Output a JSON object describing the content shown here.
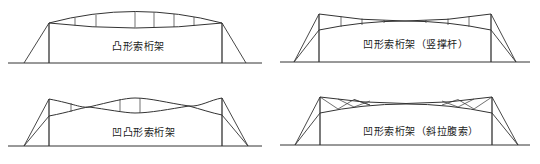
{
  "diagrams": [
    {
      "id": "convex",
      "label": "凸形索桁架",
      "label_pos": [
        112,
        38
      ],
      "ground": {
        "y": 63,
        "x1": 8,
        "x2": 262
      },
      "columns": [
        {
          "x": 49,
          "top": 23
        },
        {
          "x": 222,
          "top": 23
        }
      ],
      "guys": [
        [
          49,
          23,
          24,
          63
        ],
        [
          222,
          23,
          246,
          63
        ]
      ],
      "upper_cable": "M49,23 Q135,0 222,23",
      "lower_cable": "M49,23 Q135,33 222,23",
      "struts": [
        [
          75,
          18,
          75,
          25.5
        ],
        [
          96,
          15,
          96,
          26.5
        ],
        [
          135,
          12,
          135,
          27.5
        ],
        [
          154,
          12.5,
          154,
          27.5
        ],
        [
          174,
          14,
          174,
          27
        ],
        [
          194,
          17,
          194,
          26
        ]
      ]
    },
    {
      "id": "concave-vertical",
      "label": "凹形索桁架（竖撑杆）",
      "label_pos": [
        363,
        36
      ],
      "ground": {
        "y": 62,
        "x1": 280,
        "x2": 530
      },
      "columns": [
        {
          "x": 319,
          "top": 14
        },
        {
          "x": 491,
          "top": 14
        }
      ],
      "guys": [
        [
          319,
          14,
          294,
          62
        ],
        [
          319,
          30,
          294,
          62
        ],
        [
          491,
          14,
          516,
          62
        ],
        [
          491,
          30,
          516,
          62
        ]
      ],
      "upper_cable": "M319,14 Q405,28 491,14",
      "lower_cable": "M319,30 Q405,12 491,30",
      "struts": [
        [
          341,
          16.5,
          341,
          27
        ],
        [
          362,
          18.5,
          362,
          25
        ],
        [
          384,
          20,
          384,
          23
        ],
        [
          426,
          20,
          426,
          23
        ],
        [
          448,
          18.5,
          448,
          25
        ],
        [
          469,
          16.5,
          469,
          27
        ]
      ]
    },
    {
      "id": "concave-convex",
      "label": "凹凸形索桁架",
      "label_pos": [
        112,
        124
      ],
      "ground": {
        "y": 146,
        "x1": 8,
        "x2": 262
      },
      "columns": [
        {
          "x": 49,
          "top": 99
        },
        {
          "x": 222,
          "top": 98
        }
      ],
      "guys": [
        [
          49,
          99,
          24,
          146
        ],
        [
          49,
          116,
          24,
          146
        ],
        [
          222,
          98,
          248,
          146
        ],
        [
          222,
          115,
          248,
          146
        ]
      ],
      "upper_cable": "M49,99 C75,104 80,108 89,107 C110,102 125,98 135,98 C150,98 168,103 189,106 C200,107 210,100 222,98",
      "lower_cable": "M49,116 C70,112 80,108 89,107 C105,109 125,113 135,113 C150,113 170,109 189,106 C200,109 212,113 222,115",
      "struts": [
        [
          71,
          103,
          71,
          112
        ],
        [
          120,
          99,
          120,
          112
        ],
        [
          140,
          98,
          140,
          113
        ]
      ]
    },
    {
      "id": "concave-diagonal",
      "label": "凹形索桁架（斜拉腹索）",
      "label_pos": [
        363,
        123
      ],
      "ground": {
        "y": 145,
        "x1": 280,
        "x2": 530
      },
      "columns": [
        {
          "x": 320,
          "top": 97
        },
        {
          "x": 492,
          "top": 97
        }
      ],
      "guys": [
        [
          320,
          97,
          295,
          145
        ],
        [
          320,
          113,
          295,
          145
        ],
        [
          492,
          97,
          518,
          145
        ],
        [
          492,
          113,
          518,
          145
        ]
      ],
      "upper_cable": "M320,97 Q406,110 492,97",
      "lower_cable": "M320,113 Q406,95 492,113",
      "struts": [],
      "diagonals": [
        [
          320,
          97,
          338,
          109
        ],
        [
          338,
          109,
          354,
          99.5
        ],
        [
          354,
          99.5,
          370,
          105
        ],
        [
          370,
          105,
          354,
          99.5
        ],
        [
          338,
          99,
          354,
          107
        ],
        [
          354,
          107,
          370,
          101
        ],
        [
          492,
          97,
          474,
          109
        ],
        [
          474,
          109,
          458,
          99.5
        ],
        [
          458,
          99.5,
          442,
          105
        ],
        [
          474,
          99,
          458,
          107
        ],
        [
          458,
          107,
          442,
          101
        ]
      ]
    }
  ],
  "colors": {
    "line": "#333333",
    "text": "#222222",
    "background": "#ffffff"
  }
}
